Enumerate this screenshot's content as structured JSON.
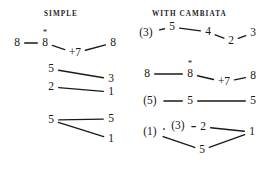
{
  "figure": {
    "type": "diagram",
    "subtype": "music-cadence-formula",
    "background_color": "#ffffff",
    "ink_color": "#1b1a17",
    "width": 267,
    "height": 170
  },
  "headers": [
    {
      "id": "simple",
      "label": "SIMPLE",
      "x": 44,
      "y": 10
    },
    {
      "id": "cambiata",
      "label": "WITH CAMBIATA",
      "x": 152,
      "y": 10
    }
  ],
  "columns": [
    {
      "id": "simple",
      "title": "SIMPLE",
      "formulas": [
        {
          "id": "simple-1",
          "nodes": [
            {
              "label": "8",
              "x": 17,
              "y": 43,
              "starred": false
            },
            {
              "label": "8",
              "x": 45,
              "y": 43,
              "starred": true
            },
            {
              "label": "+7",
              "x": 75,
              "y": 53,
              "starred": false
            },
            {
              "label": "8",
              "x": 113,
              "y": 43,
              "starred": false
            }
          ],
          "edges": [
            {
              "from": 0,
              "to": 1
            },
            {
              "from": 1,
              "to": 2
            },
            {
              "from": 2,
              "to": 3
            }
          ]
        },
        {
          "id": "simple-2",
          "nodes": [
            {
              "label": "5",
              "x": 51,
              "y": 69,
              "starred": false
            },
            {
              "label": "3",
              "x": 111,
              "y": 79,
              "starred": false
            },
            {
              "label": "2",
              "x": 51,
              "y": 87,
              "starred": false
            },
            {
              "label": "1",
              "x": 111,
              "y": 92,
              "starred": false
            }
          ],
          "edges": [
            {
              "from": 0,
              "to": 1
            },
            {
              "from": 2,
              "to": 3
            }
          ]
        },
        {
          "id": "simple-3",
          "nodes": [
            {
              "label": "5",
              "x": 51,
              "y": 120,
              "starred": false
            },
            {
              "label": "5",
              "x": 111,
              "y": 119,
              "starred": false
            },
            {
              "label": "1",
              "x": 111,
              "y": 139,
              "starred": false
            }
          ],
          "edges": [
            {
              "from": 0,
              "to": 1
            },
            {
              "from": 0,
              "to": 2
            }
          ]
        }
      ]
    },
    {
      "id": "cambiata",
      "title": "WITH CAMBIATA",
      "formulas": [
        {
          "id": "cambiata-1",
          "nodes": [
            {
              "label": "(3)",
              "x": 146,
              "y": 33,
              "starred": false
            },
            {
              "label": "5",
              "x": 172,
              "y": 27,
              "starred": false
            },
            {
              "label": "4",
              "x": 208,
              "y": 32,
              "starred": false
            },
            {
              "label": "2",
              "x": 231,
              "y": 41,
              "starred": false
            },
            {
              "label": "3",
              "x": 253,
              "y": 33,
              "starred": false
            }
          ],
          "edges": [
            {
              "from": 0,
              "to": 1
            },
            {
              "from": 1,
              "to": 2
            },
            {
              "from": 2,
              "to": 3
            },
            {
              "from": 3,
              "to": 4
            }
          ]
        },
        {
          "id": "cambiata-2",
          "nodes": [
            {
              "label": "8",
              "x": 147,
              "y": 74,
              "starred": false
            },
            {
              "label": "8",
              "x": 190,
              "y": 74,
              "starred": true
            },
            {
              "label": "+7",
              "x": 224,
              "y": 82,
              "starred": false
            },
            {
              "label": "8",
              "x": 253,
              "y": 76,
              "starred": false
            }
          ],
          "edges": [
            {
              "from": 0,
              "to": 1
            },
            {
              "from": 1,
              "to": 2
            },
            {
              "from": 2,
              "to": 3
            }
          ]
        },
        {
          "id": "cambiata-3",
          "nodes": [
            {
              "label": "(5)",
              "x": 150,
              "y": 101,
              "starred": false
            },
            {
              "label": "5",
              "x": 190,
              "y": 101,
              "starred": false
            },
            {
              "label": "5",
              "x": 253,
              "y": 101,
              "starred": false
            }
          ],
          "edges": [
            {
              "from": 0,
              "to": 1
            },
            {
              "from": 1,
              "to": 2
            }
          ]
        },
        {
          "id": "cambiata-4",
          "nodes": [
            {
              "label": "(1)",
              "x": 150,
              "y": 132,
              "starred": false
            },
            {
              "label": "(3)",
              "x": 178,
              "y": 126,
              "starred": false
            },
            {
              "label": "2",
              "x": 203,
              "y": 127,
              "starred": false
            },
            {
              "label": "1",
              "x": 252,
              "y": 132,
              "starred": false
            },
            {
              "label": "5",
              "x": 202,
              "y": 150,
              "starred": false
            }
          ],
          "edges": [
            {
              "from": 0,
              "to": 1
            },
            {
              "from": 1,
              "to": 2
            },
            {
              "from": 2,
              "to": 3
            },
            {
              "from": 0,
              "to": 4
            },
            {
              "from": 4,
              "to": 3
            }
          ]
        }
      ]
    }
  ],
  "annotations": {
    "star_glyph": "*",
    "star_meaning": "starred-note-marker"
  }
}
